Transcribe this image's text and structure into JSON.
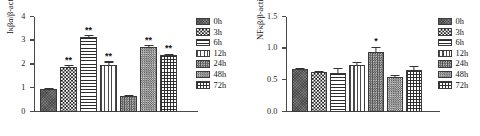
{
  "figure": {
    "panels": [
      {
        "id": "panel-ikba",
        "chart_data": {
          "type": "bar",
          "title": "",
          "xlabel": "",
          "ylabel": "Iκβα/β-actin",
          "ylim": [
            0,
            4
          ],
          "yticks": [
            "0",
            "1",
            "2",
            "3",
            "4"
          ],
          "ytick_values": [
            0,
            1,
            2,
            3,
            4
          ],
          "grid": false,
          "legend_position": "right",
          "categories": [
            "0h",
            "3h",
            "6h",
            "12h",
            "24h",
            "48h",
            "72h"
          ],
          "values": [
            0.95,
            1.9,
            3.15,
            2.0,
            0.67,
            2.75,
            2.4
          ],
          "errors": [
            0.05,
            0.06,
            0.09,
            0.12,
            0.04,
            0.06,
            0.05
          ],
          "significance": [
            "",
            "**",
            "**",
            "**",
            "",
            "**",
            "**"
          ],
          "patterns": [
            "p-solid",
            "p-check",
            "p-hline",
            "p-vline",
            "p-dot-dark",
            "p-dot-light",
            "p-grid"
          ]
        }
      },
      {
        "id": "panel-nfkb",
        "chart_data": {
          "type": "bar",
          "title": "",
          "xlabel": "",
          "ylabel": "NFκβ/β-actin",
          "ylim": [
            0,
            1.5
          ],
          "yticks": [
            "0.0",
            "0.5",
            "1.0",
            "1.5"
          ],
          "ytick_values": [
            0,
            0.5,
            1.0,
            1.5
          ],
          "grid": false,
          "legend_position": "right",
          "categories": [
            "0h",
            "3h",
            "6h",
            "12h",
            "24h",
            "48h",
            "72h"
          ],
          "values": [
            0.68,
            0.63,
            0.61,
            0.74,
            0.95,
            0.55,
            0.67
          ],
          "errors": [
            0.015,
            0.02,
            0.08,
            0.045,
            0.08,
            0.03,
            0.06
          ],
          "significance": [
            "",
            "",
            "",
            "",
            "*",
            "",
            ""
          ],
          "patterns": [
            "p-solid",
            "p-check",
            "p-hline",
            "p-vline",
            "p-dot-dark",
            "p-dot-light",
            "p-grid"
          ]
        }
      }
    ],
    "legend_entries": [
      "0h",
      "3h",
      "6h",
      "12h",
      "24h",
      "48h",
      "72h"
    ],
    "colors": {
      "axis": "#4a4a4a",
      "bar_outline": "#3a3a3a",
      "text": "#111111",
      "background": "#ffffff"
    }
  }
}
